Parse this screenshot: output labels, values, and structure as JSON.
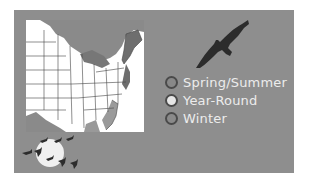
{
  "colors": {
    "panel_background": "#8e8e8e",
    "map_land": "#ffffff",
    "map_range_shade": "#8a8a8a",
    "map_dark_range": "#6e6e6e",
    "silhouette": "#2c2c2c",
    "moon": "#f0f0f0",
    "legend_text": "#ececec"
  },
  "icons": {
    "main_bird": "soaring-hawk-silhouette",
    "flock": "geese-flying-across-moon"
  },
  "map": {
    "region": "Eastern United States range map"
  },
  "legend": {
    "items": [
      {
        "label": "Spring/Summer",
        "swatch_color": "#888888"
      },
      {
        "label": "Year-Round",
        "swatch_color": "#e6e6e6"
      },
      {
        "label": "Winter",
        "swatch_color": "#8a8a8a"
      }
    ]
  }
}
